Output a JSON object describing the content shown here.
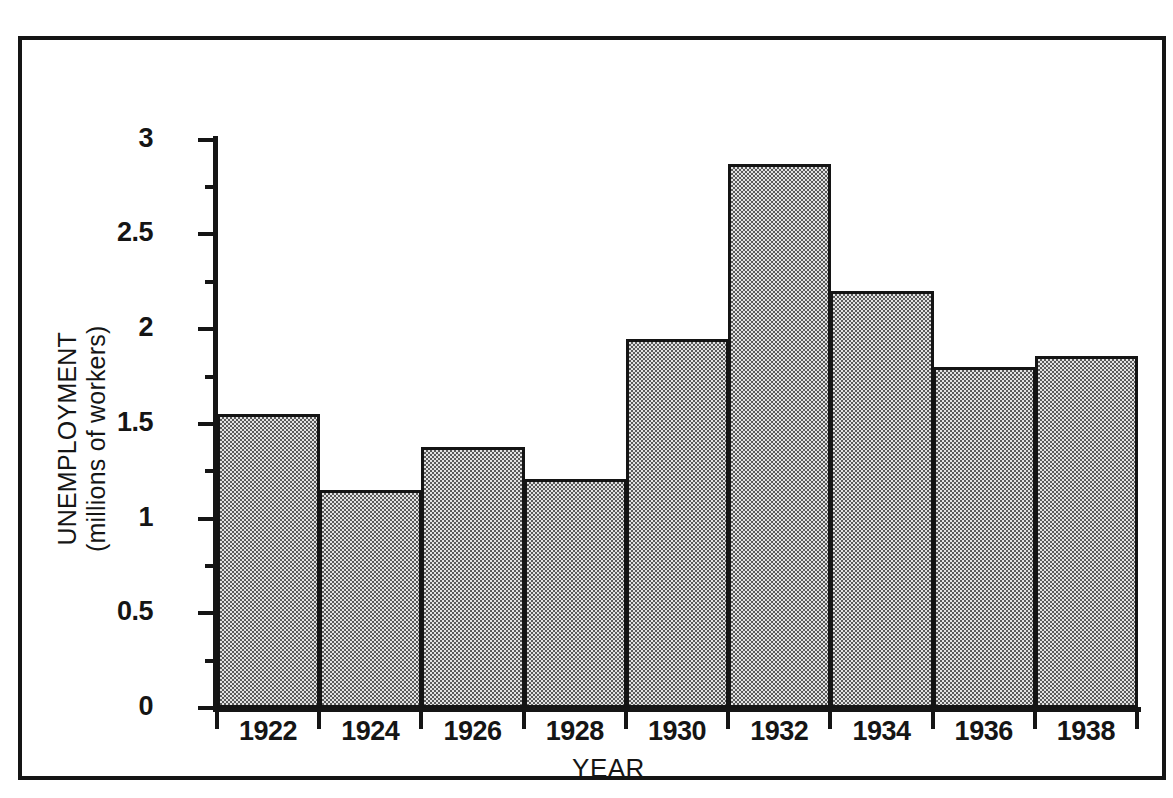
{
  "chart_data": {
    "type": "bar",
    "title": "",
    "subtitle": "",
    "xlabel": "YEAR",
    "ylabel_line1": "UNEMPLOYMENT",
    "ylabel_line2": "(millions of workers)",
    "ylabel": "UNEMPLOYMENT (millions of workers)",
    "categories": [
      "1922",
      "1924",
      "1926",
      "1928",
      "1930",
      "1932",
      "1934",
      "1936",
      "1938"
    ],
    "values": [
      1.55,
      1.15,
      1.38,
      1.21,
      1.95,
      2.87,
      2.2,
      1.8,
      1.86
    ],
    "ylim": [
      0,
      3.02
    ],
    "xlim_categories": 9,
    "y_major_ticks": [
      0,
      0.5,
      1,
      1.5,
      2,
      2.5,
      3
    ],
    "y_major_tick_labels": [
      "0",
      "0.5",
      "1",
      "1.5",
      "2",
      "2.5",
      "3"
    ],
    "y_minor_ticks": [
      0.25,
      0.75,
      1.25,
      1.75,
      2.25,
      2.75
    ],
    "grid": false,
    "legend": null,
    "legend_position": "none",
    "annotations": []
  },
  "style": {
    "bar_fill": "#c2c2c2",
    "bar_fill_dither_dark": "#5a5a5a",
    "bar_fill_dither_light": "#e2e2e2",
    "bar_stroke": "#141414",
    "axis_color": "#151515",
    "background": "#ffffff",
    "frame_color": "#151515"
  }
}
